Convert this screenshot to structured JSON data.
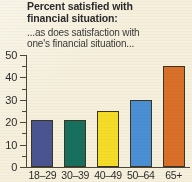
{
  "background_color": "#f5efdc",
  "title": {
    "line1": "Percent satisfied with",
    "line2": "financial situation:"
  },
  "subtitle": {
    "line1": "...as does satisfaction with",
    "line2": "one's financial situation..."
  },
  "chart_data": {
    "type": "bar",
    "title": "Percent satisfied with financial situation:",
    "subtitle": "...as does satisfaction with one's financial situation...",
    "xlabel": "",
    "ylabel": "",
    "ylim": [
      0,
      50
    ],
    "grid": false,
    "legend": "none",
    "y_major_ticks": [
      0,
      10,
      20,
      30,
      40,
      50
    ],
    "y_minor_ticks": [
      5,
      15,
      25,
      35,
      45
    ],
    "y_tick_labels": [
      "0",
      "10",
      "20",
      "30",
      "40",
      "50"
    ],
    "categories": [
      "18–29",
      "30–39",
      "40–49",
      "50–64",
      "65+"
    ],
    "values": [
      21,
      21,
      25,
      30,
      45
    ],
    "bar_colors": [
      "#4a5490",
      "#17705e",
      "#f5dc28",
      "#4a8fd4",
      "#d9702a"
    ],
    "bar_outline_color": "#3b3524",
    "axis_color": "#4b4638"
  }
}
